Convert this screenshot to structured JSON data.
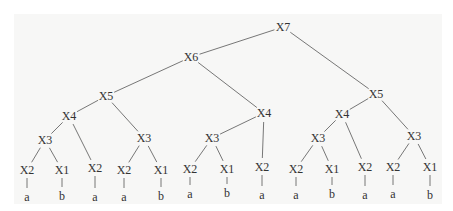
{
  "diagram": {
    "type": "tree",
    "nodes": [
      {
        "id": "n0",
        "label": "X7",
        "x": 283,
        "y": 27
      },
      {
        "id": "n1",
        "label": "X6",
        "x": 191,
        "y": 57
      },
      {
        "id": "n2",
        "label": "X5",
        "x": 376,
        "y": 94
      },
      {
        "id": "n3",
        "label": "X5",
        "x": 106,
        "y": 96
      },
      {
        "id": "n4",
        "label": "X4",
        "x": 264,
        "y": 113
      },
      {
        "id": "n5",
        "label": "X4",
        "x": 69,
        "y": 116
      },
      {
        "id": "n6",
        "label": "X3",
        "x": 144,
        "y": 138
      },
      {
        "id": "n7",
        "label": "X3",
        "x": 45,
        "y": 140
      },
      {
        "id": "n8",
        "label": "X2",
        "x": 95,
        "y": 168
      },
      {
        "id": "n9",
        "label": "X2",
        "x": 27,
        "y": 170
      },
      {
        "id": "n10",
        "label": "X1",
        "x": 62,
        "y": 170
      },
      {
        "id": "n11",
        "label": "X2",
        "x": 124,
        "y": 170
      },
      {
        "id": "n12",
        "label": "X1",
        "x": 161,
        "y": 170
      },
      {
        "id": "n13",
        "label": "X3",
        "x": 212,
        "y": 138
      },
      {
        "id": "n14",
        "label": "X2",
        "x": 262,
        "y": 167
      },
      {
        "id": "n15",
        "label": "X2",
        "x": 190,
        "y": 169
      },
      {
        "id": "n16",
        "label": "X1",
        "x": 227,
        "y": 169
      },
      {
        "id": "n17",
        "label": "X4",
        "x": 342,
        "y": 114
      },
      {
        "id": "n18",
        "label": "X3",
        "x": 414,
        "y": 136
      },
      {
        "id": "n19",
        "label": "X3",
        "x": 318,
        "y": 138
      },
      {
        "id": "n20",
        "label": "X2",
        "x": 365,
        "y": 167
      },
      {
        "id": "n21",
        "label": "X2",
        "x": 296,
        "y": 169
      },
      {
        "id": "n22",
        "label": "X1",
        "x": 332,
        "y": 169
      },
      {
        "id": "n23",
        "label": "X2",
        "x": 393,
        "y": 167
      },
      {
        "id": "n24",
        "label": "X1",
        "x": 430,
        "y": 167
      }
    ],
    "edges": [
      [
        "n0",
        "n1"
      ],
      [
        "n0",
        "n2"
      ],
      [
        "n1",
        "n3"
      ],
      [
        "n1",
        "n4"
      ],
      [
        "n3",
        "n5"
      ],
      [
        "n3",
        "n6"
      ],
      [
        "n5",
        "n7"
      ],
      [
        "n5",
        "n8"
      ],
      [
        "n7",
        "n9"
      ],
      [
        "n7",
        "n10"
      ],
      [
        "n6",
        "n11"
      ],
      [
        "n6",
        "n12"
      ],
      [
        "n4",
        "n13"
      ],
      [
        "n4",
        "n14"
      ],
      [
        "n13",
        "n15"
      ],
      [
        "n13",
        "n16"
      ],
      [
        "n2",
        "n17"
      ],
      [
        "n2",
        "n18"
      ],
      [
        "n17",
        "n19"
      ],
      [
        "n17",
        "n20"
      ],
      [
        "n19",
        "n21"
      ],
      [
        "n19",
        "n22"
      ],
      [
        "n18",
        "n23"
      ],
      [
        "n18",
        "n24"
      ]
    ],
    "leaves": [
      {
        "parent": "n9",
        "label": "a",
        "x": 27,
        "y": 197
      },
      {
        "parent": "n10",
        "label": "b",
        "x": 62,
        "y": 196
      },
      {
        "parent": "n8",
        "label": "a",
        "x": 97,
        "y": 197
      },
      {
        "parent": "n11",
        "label": "a",
        "x": 122,
        "y": 197
      },
      {
        "parent": "n12",
        "label": "b",
        "x": 160,
        "y": 196
      },
      {
        "parent": "n15",
        "label": "a",
        "x": 188,
        "y": 194
      },
      {
        "parent": "n16",
        "label": "b",
        "x": 227,
        "y": 193
      },
      {
        "parent": "n14",
        "label": "a",
        "x": 262,
        "y": 195
      },
      {
        "parent": "n21",
        "label": "a",
        "x": 291,
        "y": 195
      },
      {
        "parent": "n22",
        "label": "b",
        "x": 330,
        "y": 194
      },
      {
        "parent": "n20",
        "label": "a",
        "x": 366,
        "y": 195
      },
      {
        "parent": "n23",
        "label": "a",
        "x": 389,
        "y": 194
      },
      {
        "parent": "n24",
        "label": "b",
        "x": 428,
        "y": 195
      }
    ]
  },
  "style": {
    "line_color": "#555555",
    "text_color": "#333333",
    "panel_color": "#f7f7f6"
  }
}
